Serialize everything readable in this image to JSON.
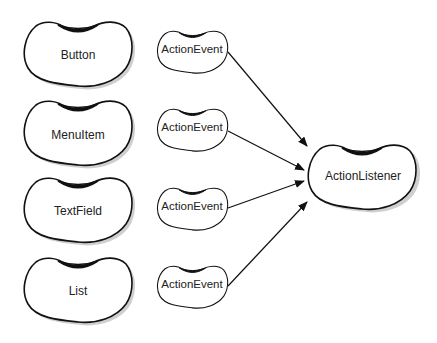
{
  "diagram": {
    "sources": [
      {
        "label": "Button"
      },
      {
        "label": "MenuItem"
      },
      {
        "label": "TextField"
      },
      {
        "label": "List"
      }
    ],
    "events": [
      {
        "label": "ActionEvent"
      },
      {
        "label": "ActionEvent"
      },
      {
        "label": "ActionEvent"
      },
      {
        "label": "ActionEvent"
      }
    ],
    "listener": {
      "label": "ActionListener"
    },
    "colors": {
      "stroke": "#111111",
      "shadow": "#c8c8c8",
      "fill": "#ffffff"
    }
  }
}
